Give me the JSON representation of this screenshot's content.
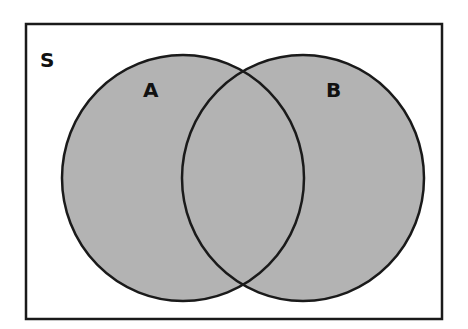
{
  "diagram": {
    "type": "venn",
    "universe_label": "S",
    "sets": [
      {
        "label": "A"
      },
      {
        "label": "B"
      }
    ],
    "colors": {
      "fill": "#b3b3b3",
      "stroke": "#1a1a1a",
      "background": "#ffffff"
    }
  }
}
